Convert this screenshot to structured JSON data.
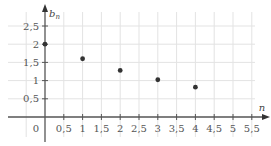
{
  "chart_data": {
    "type": "scatter",
    "title": "",
    "xlabel": "n",
    "ylabel": "b",
    "ylabel_subscript": "n",
    "xlim": [
      -1.0,
      5.75
    ],
    "ylim": [
      -0.25,
      2.85
    ],
    "grid": true,
    "x_ticks": [
      0.5,
      1,
      1.5,
      2,
      2.5,
      3,
      3.5,
      4,
      4.5,
      5,
      5.5
    ],
    "x_tick_labels": [
      "0,5",
      "1",
      "1,5",
      "2",
      "2,5",
      "3",
      "3,5",
      "4",
      "4,5",
      "5",
      "5,5"
    ],
    "y_ticks": [
      0.5,
      1,
      1.5,
      2,
      2.5
    ],
    "y_tick_labels": [
      "0,5",
      "1",
      "1,5",
      "2",
      "2,5"
    ],
    "origin_label": "0",
    "series": [
      {
        "name": "b_n",
        "color": "#333333",
        "points": [
          {
            "x": 0,
            "y": 2
          },
          {
            "x": 1,
            "y": 1.6
          },
          {
            "x": 2,
            "y": 1.28
          },
          {
            "x": 3,
            "y": 1.024
          },
          {
            "x": 4,
            "y": 0.8192
          }
        ]
      }
    ],
    "colors": {
      "axis": "#555555",
      "grid": "#e3e3e3",
      "point": "#333333"
    }
  }
}
